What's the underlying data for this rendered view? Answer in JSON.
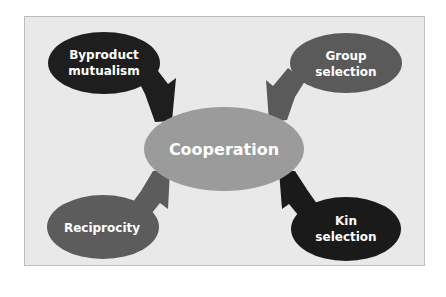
{
  "diagram": {
    "center": {
      "label": "Cooperation",
      "color": "#9b9b9b"
    },
    "nodes": [
      {
        "id": "byproduct",
        "lines": [
          "Byproduct",
          "mutualism"
        ],
        "color": "#1e1e1e",
        "position": "top-left"
      },
      {
        "id": "group",
        "lines": [
          "Group",
          "selection"
        ],
        "color": "#5a5a5a",
        "position": "top-right"
      },
      {
        "id": "reciprocity",
        "lines": [
          "Reciprocity"
        ],
        "color": "#5c5c5c",
        "position": "bottom-left"
      },
      {
        "id": "kin",
        "lines": [
          "Kin",
          "selection"
        ],
        "color": "#1a1a1a",
        "position": "bottom-right"
      }
    ],
    "edges": [
      {
        "from": "byproduct",
        "to": "center"
      },
      {
        "from": "group",
        "to": "center"
      },
      {
        "from": "reciprocity",
        "to": "center"
      },
      {
        "from": "kin",
        "to": "center"
      }
    ],
    "panel_color": "#e9e9e9",
    "panel_border": "#bdbdbd"
  }
}
